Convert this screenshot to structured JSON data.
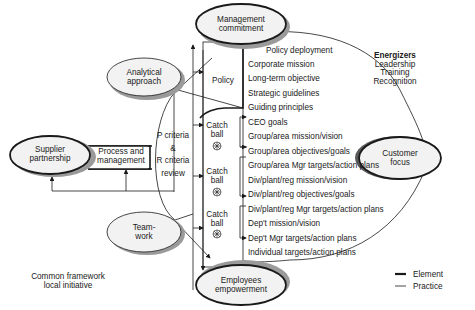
{
  "nodes": {
    "management_commitment": {
      "line1": "Management",
      "line2": "commitment"
    },
    "analytical_approach": {
      "line1": "Analytical",
      "line2": "approach"
    },
    "supplier_partnership": {
      "line1": "Supplier",
      "line2": "partnership"
    },
    "process_management": {
      "line1": "Process and",
      "line2": "management"
    },
    "teamwork": {
      "line1": "Team-",
      "line2": "work"
    },
    "customer_focus": {
      "line1": "Customer",
      "line2": "focus"
    },
    "employees_empowerment": {
      "line1": "Employees",
      "line2": "empowerment"
    }
  },
  "review": {
    "line1": "P criteria",
    "line2": "&",
    "line3": "R criteria",
    "line4": "review"
  },
  "policy_label": "Policy",
  "catch_balls": [
    {
      "line1": "Catch",
      "line2": "ball"
    },
    {
      "line1": "Catch",
      "line2": "ball"
    },
    {
      "line1": "Catch",
      "line2": "ball"
    }
  ],
  "policy_deployment": "Policy deployment",
  "list": [
    "Corporate mission",
    "Long-term objective",
    "Strategic guidelines",
    "Guiding principles",
    "CEO goals",
    "Group/area mission/vision",
    "Group/area objectives/goals",
    "Group/area Mgr targets/action plans",
    "Div/plant/reg mission/vision",
    "Div/plant/reg objectives/goals",
    "Div/plant/reg Mgr targets/action plans",
    "Dep't mission/vision",
    "Dep't Mgr targets/action plans",
    "Individual targets/action plans"
  ],
  "energizers": {
    "title": "Energizers",
    "items": [
      "Leadership",
      "Training",
      "Recognition"
    ]
  },
  "footer_note": {
    "line1": "Common framework",
    "line2": "local initiative"
  },
  "legend": {
    "element": "Element",
    "practice": "Practice"
  },
  "colors": {
    "line": "#1a1a1a",
    "ellipse_fill": "#f2f2f2",
    "shadow": "#9a9a9a"
  }
}
